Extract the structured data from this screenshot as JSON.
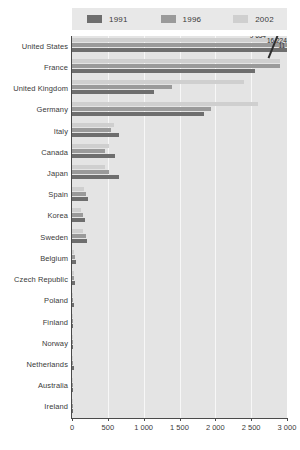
{
  "legend": {
    "items": [
      {
        "label": "1991",
        "color": "#6e6e6e"
      },
      {
        "label": "1996",
        "color": "#9a9a9a"
      },
      {
        "label": "2002",
        "color": "#cfcfcf"
      }
    ]
  },
  "axis": {
    "x_ticks": [
      "0",
      "500",
      "1 000",
      "1 500",
      "2 000",
      "2 500",
      "3 000"
    ],
    "x_min": 0,
    "x_max": 3000
  },
  "overflow_labels": [
    {
      "text": "9 654",
      "x": 2480,
      "row": 0,
      "line": 0
    },
    {
      "text": "16 224",
      "x": 2720,
      "row": 0,
      "line": 1
    },
    {
      "text": "11 029",
      "x": 2880,
      "row": 0,
      "line": 2
    }
  ],
  "chart_data": {
    "type": "bar",
    "orientation": "horizontal",
    "title": "",
    "xlabel": "",
    "ylabel": "",
    "xlim": [
      0,
      3000
    ],
    "grid": true,
    "legend_position": "top",
    "note": "United States bars exceed the axis maximum; values shown as labels with an axis break.",
    "categories": [
      "United States",
      "France",
      "United Kingdom",
      "Germany",
      "Italy",
      "Canada",
      "Japan",
      "Spain",
      "Korea",
      "Sweden",
      "Belgium",
      "Czech Republic",
      "Poland",
      "Finland",
      "Norway",
      "Netherlands",
      "Australia",
      "Ireland"
    ],
    "series": [
      {
        "name": "1991",
        "color": "#6e6e6e",
        "values": [
          9654,
          2550,
          1140,
          1840,
          660,
          600,
          650,
          230,
          180,
          210,
          55,
          40,
          22,
          18,
          20,
          28,
          16,
          10
        ]
      },
      {
        "name": "1996",
        "color": "#9a9a9a",
        "values": [
          16224,
          2905,
          1390,
          1940,
          540,
          460,
          520,
          200,
          150,
          190,
          40,
          30,
          18,
          14,
          12,
          14,
          10,
          8
        ]
      },
      {
        "name": "2002",
        "color": "#cfcfcf",
        "values": [
          11029,
          2900,
          2400,
          2600,
          590,
          510,
          460,
          165,
          120,
          150,
          30,
          22,
          14,
          10,
          8,
          10,
          8,
          6
        ]
      }
    ]
  }
}
